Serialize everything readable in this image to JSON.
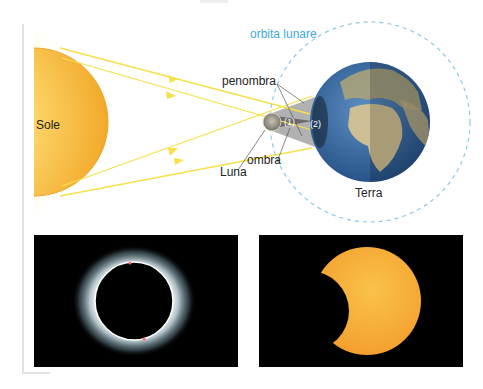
{
  "diagram": {
    "labels": {
      "sun": "Sole",
      "earth": "Terra",
      "moon": "Luna",
      "lunar_orbit": "orbita lunare",
      "penumbra": "penombra",
      "umbra": "ombra",
      "region_1": "(1)",
      "region_2": "(2)"
    },
    "colors": {
      "sun_fill": "#f5b731",
      "sun_glow": "#fff27a",
      "rays": "#f7e04a",
      "orbit": "#8fc8e6",
      "orbit_label": "#3fa9e0",
      "penumbra": "#9a9a9a",
      "umbra": "#6b6b6b",
      "ocean": "#3a6ea5",
      "land": "#c9b98a"
    }
  },
  "photos": [
    {
      "caption": "total-solar-eclipse",
      "kind": "corona ring"
    },
    {
      "caption": "partial-solar-eclipse",
      "kind": "crescent sun"
    }
  ]
}
